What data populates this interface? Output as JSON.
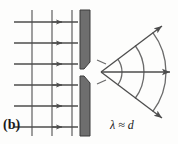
{
  "figure": {
    "panel_label": "(b)",
    "condition_label": "λ ≈ d",
    "colors": {
      "background": "#fdfdfc",
      "barrier_fill": "#6e6e6e",
      "barrier_stroke": "#3a3a3a",
      "line": "#4d4d4d",
      "text": "#1a1a1a"
    }
  },
  "diagram": {
    "type": "wave-diffraction-single-slit",
    "incident_waves": {
      "name": "plane-wavefronts",
      "wavefront_count": 3,
      "wavefront_x": [
        32,
        52,
        72
      ],
      "wavefront_y_top": 10,
      "wavefront_y_bottom": 136,
      "ray_count": 6,
      "ray_y": [
        22,
        43,
        64,
        85,
        106,
        127
      ],
      "ray_x_start": 14,
      "ray_x_end": 78,
      "direction": "rightward"
    },
    "barrier": {
      "name": "slit-barrier",
      "upper_segment": {
        "x": 80,
        "y_top": 10,
        "y_bottom": 68,
        "width": 10
      },
      "lower_segment": {
        "x": 80,
        "y_top": 76,
        "y_bottom": 136,
        "width": 10
      },
      "slit_center_x": 100,
      "slit_center_y": 72,
      "slit_gap": 8
    },
    "diffracted_waves": {
      "name": "circular-wavefronts",
      "arc_count": 3,
      "arc_radii": [
        22,
        44,
        66
      ],
      "origin_x": 100,
      "origin_y": 72,
      "spread_angle_degrees": 70,
      "ray_count": 3,
      "ray_angles_degrees": [
        -37,
        0,
        37
      ]
    }
  }
}
